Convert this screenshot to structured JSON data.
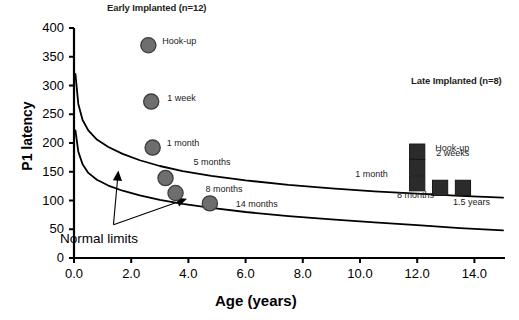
{
  "chart_data": {
    "type": "scatter",
    "title": "",
    "xlabel": "Age (years)",
    "ylabel": "P1 latency",
    "xlim": [
      0.0,
      15.0
    ],
    "ylim": [
      0,
      400
    ],
    "grid": false,
    "legend": "none",
    "xticks": [
      "0.0",
      "2.0",
      "4.0",
      "6.0",
      "8.0",
      "10.0",
      "12.0",
      "14.0"
    ],
    "xtick_values": [
      0,
      2,
      4,
      6,
      8,
      10,
      12,
      14
    ],
    "yticks": [
      "0",
      "50",
      "100",
      "150",
      "200",
      "250",
      "300",
      "350",
      "400"
    ],
    "ytick_values": [
      0,
      50,
      100,
      150,
      200,
      250,
      300,
      350,
      400
    ],
    "series": [
      {
        "name": "Early Implanted (n=12)",
        "marker": "circle",
        "color": "#6e6e6e",
        "points": [
          {
            "label": "Hook-up",
            "x": 2.6,
            "y": 370,
            "label_dx": 14,
            "label_dy": -4
          },
          {
            "label": "1 week",
            "x": 2.7,
            "y": 272,
            "label_dx": 16,
            "label_dy": -4
          },
          {
            "label": "1 month",
            "x": 2.75,
            "y": 192,
            "label_dx": 14,
            "label_dy": -5
          },
          {
            "label": "5 months",
            "x": 3.2,
            "y": 139,
            "label_dx": 28,
            "label_dy": -16
          },
          {
            "label": "8 months",
            "x": 3.55,
            "y": 113,
            "label_dx": 30,
            "label_dy": -4
          },
          {
            "label": "14 months",
            "x": 4.75,
            "y": 95,
            "label_dx": 26,
            "label_dy": 1
          }
        ]
      },
      {
        "name": "Late Implanted (n=8)",
        "marker": "square",
        "color": "#2b2b2b",
        "points": [
          {
            "label": "Hook-up",
            "x": 12.0,
            "y": 185,
            "label_dx": 18,
            "label_dy": -4
          },
          {
            "label": "2 weeks",
            "x": 12.0,
            "y": 158,
            "label_dx": 19,
            "label_dy": -14
          },
          {
            "label": "1 month",
            "x": 12.0,
            "y": 130,
            "label_dx": -62,
            "label_dy": -9
          },
          {
            "label": "8 months",
            "x": 12.8,
            "y": 122,
            "label_dx": -43,
            "label_dy": 7
          },
          {
            "label": "1.5 years",
            "x": 13.6,
            "y": 122,
            "label_dx": -10,
            "label_dy": 14
          }
        ]
      }
    ],
    "curves": [
      {
        "name": "upper-normal-limit",
        "points": [
          [
            0.05,
            320
          ],
          [
            0.15,
            268
          ],
          [
            0.3,
            240
          ],
          [
            0.5,
            222
          ],
          [
            0.8,
            206
          ],
          [
            1.2,
            193
          ],
          [
            1.7,
            181
          ],
          [
            2.3,
            170
          ],
          [
            3.0,
            160
          ],
          [
            3.8,
            151
          ],
          [
            4.8,
            143
          ],
          [
            6.0,
            135
          ],
          [
            7.5,
            127
          ],
          [
            9.0,
            121
          ],
          [
            10.5,
            116
          ],
          [
            12.0,
            112
          ],
          [
            13.5,
            108
          ],
          [
            15.0,
            105
          ]
        ]
      },
      {
        "name": "lower-normal-limit",
        "points": [
          [
            0.05,
            222
          ],
          [
            0.15,
            185
          ],
          [
            0.3,
            163
          ],
          [
            0.5,
            148
          ],
          [
            0.8,
            136
          ],
          [
            1.2,
            126
          ],
          [
            1.7,
            117
          ],
          [
            2.3,
            109
          ],
          [
            3.0,
            101
          ],
          [
            3.8,
            94
          ],
          [
            4.8,
            87
          ],
          [
            6.0,
            80
          ],
          [
            7.5,
            73
          ],
          [
            9.0,
            67
          ],
          [
            10.5,
            62
          ],
          [
            12.0,
            57
          ],
          [
            13.5,
            52
          ],
          [
            15.0,
            48
          ]
        ]
      }
    ],
    "annotations": [
      {
        "name": "normal-limits",
        "text": "Normal limits",
        "x": 1.0,
        "y": 42
      }
    ]
  },
  "labels": {
    "early_title": "Early Implanted (n=12)",
    "late_title": "Late Implanted (n=8)",
    "x_axis": "Age (years)",
    "y_axis": "P1 latency",
    "normal_limits": "Normal limits"
  }
}
